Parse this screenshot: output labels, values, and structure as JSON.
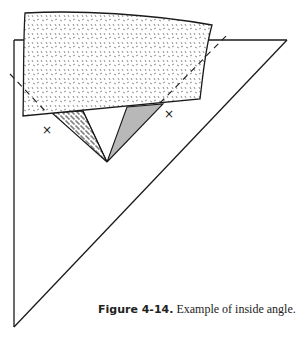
{
  "figure": {
    "label": "Figure 4-14.",
    "caption": " Example of inside angle.",
    "colors": {
      "line": "#1a1a1a",
      "gray_fill": "#b8b8b8",
      "background": "#ffffff"
    },
    "elements": [
      "large right triangle (paper)",
      "stippled rectangle overlay",
      "dashed fold line",
      "cross-hatched triangle (left wedge)",
      "gray triangle (right wedge)",
      "two x marks"
    ],
    "marks": [
      "×",
      "×"
    ]
  }
}
